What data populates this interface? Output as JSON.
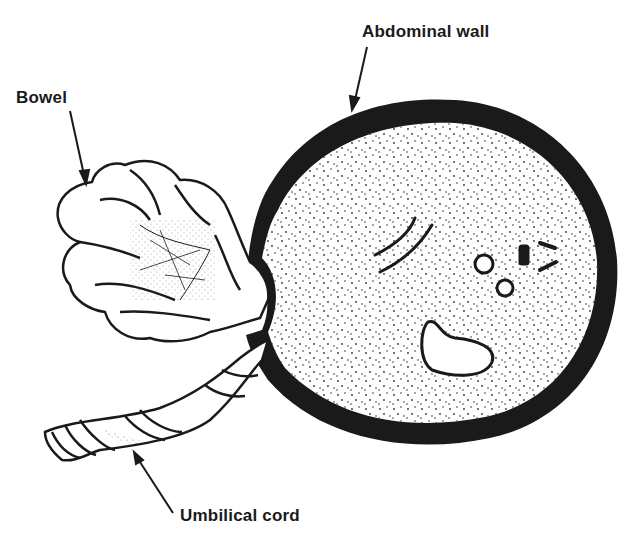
{
  "diagram": {
    "labels": {
      "abdominal_wall": "Abdominal wall",
      "bowel": "Bowel",
      "umbilical_cord": "Umbilical cord"
    },
    "colors": {
      "ink": "#1a1a1a",
      "background": "#ffffff",
      "wall_fill": "#1a1a1a"
    }
  }
}
